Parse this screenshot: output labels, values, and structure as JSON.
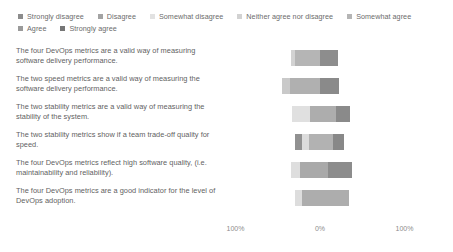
{
  "chart_data": {
    "type": "bar",
    "subtype": "diverging-stacked-likert",
    "title": "",
    "xlabel": "",
    "ylabel": "",
    "grid": false,
    "legend_position": "top-left",
    "axis": {
      "ticks": [
        "100%",
        "0%",
        "100%"
      ],
      "tick_positions_pct": [
        -100,
        0,
        100
      ],
      "zero_center": true,
      "xlim": [
        -100,
        100
      ]
    },
    "legend": [
      {
        "label": "Strongly disagree",
        "color": "#8c8c8c"
      },
      {
        "label": "Disagree",
        "color": "#a3a3a3"
      },
      {
        "label": "Somewhat disagree",
        "color": "#e2e2e2"
      },
      {
        "label": "Neither agree nor disagree",
        "color": "#d2d2d2"
      },
      {
        "label": "Somewhat agree",
        "color": "#b5b5b5"
      },
      {
        "label": "Agree",
        "color": "#9a9a9a"
      },
      {
        "label": "Strongly agree",
        "color": "#767676"
      }
    ],
    "categories": [
      "The four DevOps metrics are a valid way of measuring software delivery performance.",
      "The two speed metrics are a valid way of measuring the software delivery performance.",
      "The two stability metrics are a valid way of measuring the stability of the system.",
      "The two stability metrics show if a team trade-off quality for speed.",
      "The four DevOps metrics reflect high software quality, (i.e. maintainability and reliability).",
      "The four DevOps metrics are a good indicator for the level of DevOps adoption."
    ],
    "series": [
      {
        "name": "Strongly disagree",
        "values": [
          0,
          0,
          0,
          8,
          0,
          0
        ]
      },
      {
        "name": "Disagree",
        "values": [
          0,
          0,
          0,
          0,
          0,
          0
        ]
      },
      {
        "name": "Somewhat disagree",
        "values": [
          0,
          9,
          21,
          8,
          10,
          9
        ]
      },
      {
        "name": "Neither agree nor disagree",
        "values": [
          4,
          0,
          0,
          0,
          0,
          0
        ]
      },
      {
        "name": "Somewhat agree",
        "values": [
          30,
          36,
          30,
          29,
          33,
          55
        ]
      },
      {
        "name": "Agree",
        "values": [
          21,
          0,
          17,
          12,
          29,
          0
        ]
      },
      {
        "name": "Strongly agree",
        "values": [
          0,
          0,
          0,
          0,
          0,
          0
        ]
      }
    ],
    "bars": [
      {
        "row": 0,
        "start_pct": -34,
        "segments": [
          {
            "series": "Neither agree nor disagree",
            "pct": 4,
            "color": "#d2d2d2"
          },
          {
            "series": "Somewhat agree",
            "pct": 30,
            "color": "#b5b5b5"
          },
          {
            "series": "Agree",
            "pct": 21,
            "color": "#8d8d8d"
          }
        ]
      },
      {
        "row": 1,
        "start_pct": -45,
        "segments": [
          {
            "series": "Somewhat disagree",
            "pct": 9,
            "color": "#c9c9c9"
          },
          {
            "series": "Somewhat agree",
            "pct": 36,
            "color": "#b0b0b0"
          },
          {
            "series": "Agree",
            "pct": 22,
            "color": "#8a8a8a"
          }
        ]
      },
      {
        "row": 2,
        "start_pct": -33,
        "segments": [
          {
            "series": "Somewhat disagree",
            "pct": 21,
            "color": "#e0e0e0"
          },
          {
            "series": "Somewhat agree",
            "pct": 31,
            "color": "#adadad"
          },
          {
            "series": "Agree",
            "pct": 17,
            "color": "#8a8a8a"
          }
        ]
      },
      {
        "row": 3,
        "start_pct": -29,
        "segments": [
          {
            "series": "Strongly disagree",
            "pct": 8,
            "color": "#919191"
          },
          {
            "series": "Somewhat disagree",
            "pct": 8,
            "color": "#dcdcdc"
          },
          {
            "series": "Somewhat agree",
            "pct": 29,
            "color": "#b2b2b2"
          },
          {
            "series": "Agree",
            "pct": 12,
            "color": "#888888"
          }
        ]
      },
      {
        "row": 4,
        "start_pct": -34,
        "segments": [
          {
            "series": "Somewhat disagree",
            "pct": 10,
            "color": "#dedede"
          },
          {
            "series": "Somewhat agree",
            "pct": 33,
            "color": "#a9a9a9"
          },
          {
            "series": "Agree",
            "pct": 29,
            "color": "#8c8c8c"
          }
        ]
      },
      {
        "row": 5,
        "start_pct": -30,
        "segments": [
          {
            "series": "Somewhat disagree",
            "pct": 9,
            "color": "#dddddd"
          },
          {
            "series": "Somewhat agree",
            "pct": 55,
            "color": "#adadad"
          }
        ]
      }
    ]
  }
}
